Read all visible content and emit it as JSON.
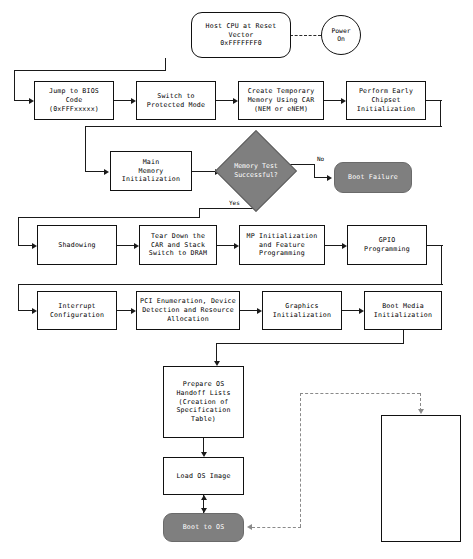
{
  "diagram": {
    "colors": {
      "process_fill": "#ffffff",
      "process_stroke": "#111111",
      "terminator_fill": "#7f7f7f",
      "terminator_text": "#ffffff",
      "decision_fill": "#7f7f7f",
      "connector": "#1a1a1a",
      "dashed_connector": "#8a8a8a"
    },
    "nodes": {
      "power_on": "Power\nOn",
      "host_cpu_reset": "Host CPU at Reset\nVector\n0xFFFFFFF0",
      "jump_to_bios": "Jump to BIOS\nCode\n(0xFFFxxxxx)",
      "switch_protected": "Switch to\nProtected Mode",
      "create_temp_memory": "Create Temporary\nMemory Using CAR\n(NEM or eNEM)",
      "early_chipset": "Perform Early\nChipset\nInitialization",
      "main_memory_init": "Main\nMemory\nInitialization",
      "memory_test": "Memory Test\nSuccessful?",
      "boot_failure": "Boot Failure",
      "shadowing": "Shadowing",
      "tear_down_car": "Tear Down the\nCAR and Stack\nSwitch to DRAM",
      "mp_init": "MP Initialization\nand Feature\nProgramming",
      "gpio_programming": "GPIO\nProgramming",
      "interrupt_config": "Interrupt\nConfiguration",
      "pci_enumeration": "PCI Enumeration, Device\nDetection and Resource\nAllocation",
      "graphics_init": "Graphics\nInitialization",
      "boot_media_init": "Boot Media\nInitialization",
      "prepare_os_handoff": "Prepare OS\nHandoff Lists\n(Creation of\nSpecification\nTable)",
      "load_os_image": "Load OS Image",
      "boot_to_os": "Boot to OS",
      "after_life_title": "After Life\n(AL)",
      "acpi_asl": "ACPI ASL",
      "runtime_service_table": "Runtime\nService\nTable",
      "smi_handlers": "SMI\nHandlers"
    },
    "edge_labels": {
      "memory_test_no": "No",
      "memory_test_yes": "Yes"
    }
  }
}
